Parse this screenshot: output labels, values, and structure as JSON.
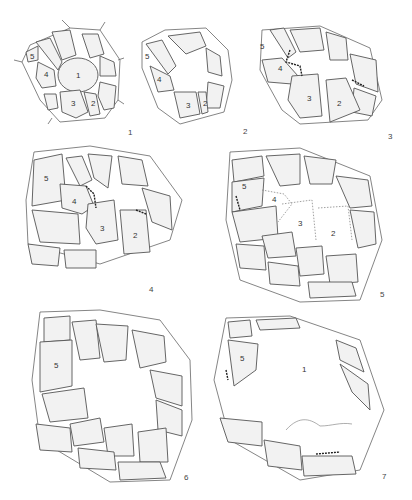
{
  "figure": {
    "panels": [
      {
        "id": "1",
        "label": "1",
        "cell_labels": [
          "1",
          "2",
          "3",
          "4",
          "5"
        ]
      },
      {
        "id": "2",
        "label": "2",
        "cell_labels": [
          "2",
          "3",
          "4",
          "5"
        ]
      },
      {
        "id": "3",
        "label": "3",
        "cell_labels": [
          "2",
          "3",
          "4",
          "5"
        ]
      },
      {
        "id": "4",
        "label": "4",
        "cell_labels": [
          "2",
          "3",
          "4",
          "5"
        ]
      },
      {
        "id": "5",
        "label": "5",
        "cell_labels": [
          "2",
          "3",
          "4",
          "5"
        ]
      },
      {
        "id": "6",
        "label": "6",
        "cell_labels": [
          "5"
        ]
      },
      {
        "id": "7",
        "label": "7",
        "cell_labels": [
          "5",
          "1"
        ]
      }
    ]
  }
}
